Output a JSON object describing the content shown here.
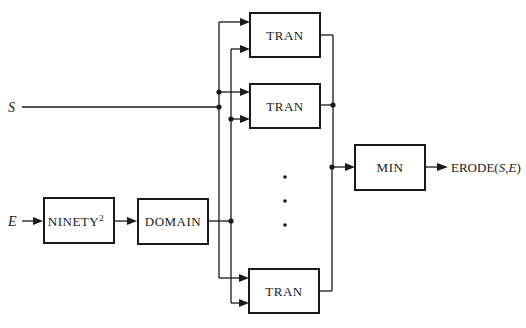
{
  "diagram": {
    "inputs": {
      "s_label": "S",
      "e_label": "E"
    },
    "blocks": {
      "ninety": {
        "label": "NINETY",
        "superscript": "2"
      },
      "domain": {
        "label": "DOMAIN"
      },
      "tran_1": {
        "label": "TRAN"
      },
      "tran_2": {
        "label": "TRAN"
      },
      "tran_n": {
        "label": "TRAN"
      },
      "min": {
        "label": "MIN"
      }
    },
    "output": {
      "prefix": "ERODE(",
      "arg1": "S",
      "sep": ",",
      "arg2": "E",
      "suffix": ")"
    },
    "ellipsis": "vertical-dots"
  }
}
